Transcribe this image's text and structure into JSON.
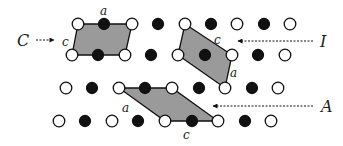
{
  "diagram": {
    "colors": {
      "shade": "#9a9a9a",
      "ink": "#111111",
      "open_fill": "#ffffff"
    },
    "labels": {
      "C": "C",
      "I": "I",
      "A": "A",
      "cell_C_a": "a",
      "cell_C_c": "c",
      "cell_I_c": "c",
      "cell_I_a": "a",
      "cell_A_a": "a",
      "cell_A_c": "c"
    },
    "rows": [
      {
        "y": 24,
        "atoms": [
          [
            78,
            "o"
          ],
          [
            104,
            "f"
          ],
          [
            132,
            "o"
          ],
          [
            158,
            "f"
          ],
          [
            185,
            "o"
          ],
          [
            211,
            "f"
          ],
          [
            237,
            "o"
          ],
          [
            264,
            "f"
          ],
          [
            290,
            "o"
          ]
        ]
      },
      {
        "y": 55,
        "atoms": [
          [
            72,
            "o"
          ],
          [
            98,
            "f"
          ],
          [
            125,
            "o"
          ],
          [
            151,
            "f"
          ],
          [
            178,
            "o"
          ],
          [
            205,
            "f"
          ],
          [
            232,
            "o"
          ],
          [
            258,
            "f"
          ],
          [
            285,
            "o"
          ]
        ]
      },
      {
        "y": 88,
        "atoms": [
          [
            66,
            "o"
          ],
          [
            92,
            "f"
          ],
          [
            119,
            "o"
          ],
          [
            145,
            "f"
          ],
          [
            172,
            "o"
          ],
          [
            199,
            "f"
          ],
          [
            225,
            "o"
          ],
          [
            252,
            "f"
          ],
          [
            278,
            "o"
          ]
        ]
      },
      {
        "y": 121,
        "atoms": [
          [
            59,
            "o"
          ],
          [
            85,
            "f"
          ],
          [
            112,
            "o"
          ],
          [
            138,
            "f"
          ],
          [
            165,
            "o"
          ],
          [
            192,
            "f"
          ],
          [
            218,
            "o"
          ],
          [
            245,
            "f"
          ],
          [
            271,
            "o"
          ]
        ]
      }
    ]
  }
}
